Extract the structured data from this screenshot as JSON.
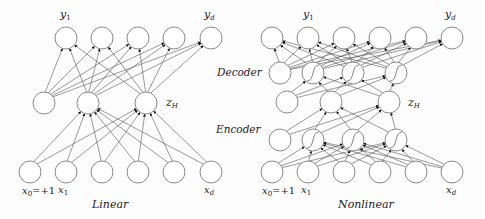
{
  "linear": {
    "caption": "Linear",
    "output_labels": {
      "first": "y1",
      "last": "yd"
    },
    "hidden_label": "zH",
    "input_labels": {
      "first": "x0=+1",
      "second": "x1",
      "last": "xd"
    },
    "layers": {
      "output": {
        "y": 38,
        "x": [
          66,
          102,
          138,
          174,
          211
        ]
      },
      "hidden": {
        "y": 103,
        "x": [
          44,
          88,
          146
        ]
      },
      "input": {
        "y": 172,
        "x": [
          30,
          66,
          102,
          138,
          174,
          211
        ]
      }
    }
  },
  "nonlinear": {
    "caption": "Nonlinear",
    "output_labels": {
      "first": "y1",
      "last": "yd"
    },
    "hidden_label": "zH",
    "input_labels": {
      "first": "x0=+1",
      "second": "x1",
      "last": "xd"
    },
    "layers": {
      "output": {
        "y": 38,
        "x": [
          272,
          308,
          344,
          380,
          416,
          452
        ]
      },
      "decoder_hidden": {
        "y": 73,
        "x": [
          280,
          313,
          353,
          396
        ]
      },
      "bottleneck": {
        "y": 102,
        "x": [
          287,
          331,
          389
        ]
      },
      "encoder_hidden": {
        "y": 140,
        "x": [
          280,
          313,
          353,
          396
        ]
      },
      "input": {
        "y": 172,
        "x": [
          272,
          308,
          344,
          380,
          416,
          452
        ]
      }
    }
  },
  "stage_labels": {
    "decoder": "Decoder",
    "encoder": "Encoder"
  }
}
